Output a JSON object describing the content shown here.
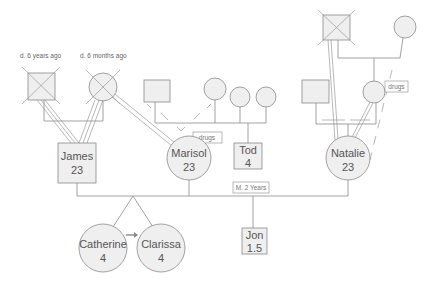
{
  "annotations": {
    "grandfather_paternal_death": "d. 6 years ago",
    "grandmother_paternal_death": "d. 6 months ago"
  },
  "people": {
    "james": {
      "name": "James",
      "age": "23",
      "sex": "male"
    },
    "marisol": {
      "name": "Marisol",
      "age": "23",
      "sex": "female"
    },
    "tod": {
      "name": "Tod",
      "age": "4",
      "sex": "male"
    },
    "natalie": {
      "name": "Natalie",
      "age": "23",
      "sex": "female"
    },
    "catherine": {
      "name": "Catherine",
      "age": "4",
      "sex": "female"
    },
    "clarissa": {
      "name": "Clarissa",
      "age": "4",
      "sex": "female"
    },
    "jon": {
      "name": "Jon",
      "age": "1.5",
      "sex": "male"
    }
  },
  "tags": {
    "marisol_mother_drugs": "drugs",
    "natalie_mother_drugs": "drugs",
    "marriage": "M. 2 Years"
  },
  "colors": {
    "line": "#8a8a8a",
    "fill": "#efefef",
    "text": "#555555",
    "arrow": "#888888"
  }
}
